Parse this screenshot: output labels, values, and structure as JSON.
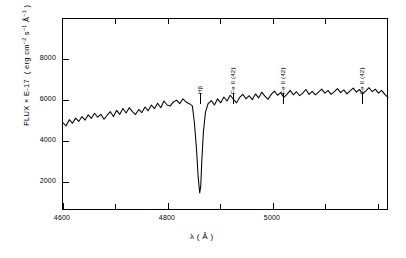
{
  "figure": {
    "background": "#ffffff",
    "ink": "#000000"
  },
  "axes": {
    "x": {
      "label": "λ (Å)",
      "min": 4600,
      "max": 5220,
      "major_ticks": [
        4600,
        4800,
        5000
      ],
      "major_tick_labels": [
        "4600",
        "4800",
        "5000"
      ],
      "minor_ticks": [
        4700,
        4900,
        5100,
        5200
      ]
    },
    "y": {
      "label_text": "FLUX × E-17  ( erg cm",
      "label_full": "FLUX × E-17 ( erg cm^-2 s^-1 A^-1 )",
      "min": 640,
      "max": 9300,
      "major_ticks": [
        2000,
        4000,
        6000,
        8000
      ],
      "major_tick_labels": [
        "2000",
        "4000",
        "6000",
        "8000"
      ]
    }
  },
  "line_markers": [
    {
      "name": "h-beta",
      "label": "Hβ",
      "wavelength": 4861,
      "tick_top": 92,
      "tick_bottom": 103
    },
    {
      "name": "fe-ii-42-a",
      "label": "Fe II (42)",
      "wavelength": 4924,
      "tick_top": 92,
      "tick_bottom": 103
    },
    {
      "name": "fe-ii-42-b",
      "label": "Fe II (42)",
      "wavelength": 5018,
      "tick_top": 92,
      "tick_bottom": 103
    },
    {
      "name": "fe-ii-42-c",
      "label": "Fe II (42)",
      "wavelength": 5169,
      "tick_top": 92,
      "tick_bottom": 103
    }
  ],
  "chart_data": {
    "type": "line",
    "title": "",
    "xlabel": "λ (Å)",
    "ylabel": "FLUX × E-17 (erg cm^-2 s^-1 A^-1)",
    "xlim": [
      4600,
      5220
    ],
    "ylim": [
      640,
      9300
    ],
    "grid": false,
    "legend": null,
    "annotations": [
      "Hβ",
      "Fe II (42)",
      "Fe II (42)",
      "Fe II (42)"
    ],
    "series": [
      {
        "name": "spectrum",
        "color": "#000000",
        "x": [
          4600,
          4606,
          4612,
          4618,
          4624,
          4630,
          4636,
          4642,
          4648,
          4654,
          4660,
          4666,
          4672,
          4678,
          4684,
          4690,
          4696,
          4702,
          4708,
          4714,
          4720,
          4726,
          4732,
          4738,
          4744,
          4750,
          4756,
          4762,
          4768,
          4774,
          4780,
          4786,
          4792,
          4798,
          4804,
          4810,
          4816,
          4822,
          4828,
          4834,
          4840,
          4846,
          4850,
          4854,
          4857,
          4860,
          4862,
          4864,
          4867,
          4871,
          4876,
          4882,
          4888,
          4894,
          4900,
          4906,
          4912,
          4918,
          4924,
          4930,
          4936,
          4942,
          4948,
          4954,
          4960,
          4966,
          4972,
          4978,
          4984,
          4990,
          4996,
          5002,
          5008,
          5014,
          5020,
          5026,
          5032,
          5038,
          5044,
          5050,
          5056,
          5062,
          5068,
          5074,
          5080,
          5086,
          5092,
          5098,
          5104,
          5110,
          5116,
          5122,
          5128,
          5134,
          5140,
          5146,
          5152,
          5158,
          5164,
          5170,
          5176,
          5182,
          5188,
          5194,
          5200,
          5206,
          5212,
          5218
        ],
        "y": [
          4620,
          4480,
          4760,
          4600,
          4830,
          4680,
          4900,
          4740,
          4980,
          4820,
          5050,
          4870,
          5000,
          4780,
          4960,
          5120,
          4900,
          5180,
          5000,
          5260,
          5060,
          5300,
          5120,
          4990,
          5220,
          5080,
          5330,
          5160,
          5420,
          5260,
          5500,
          5300,
          5600,
          5420,
          5380,
          5560,
          5640,
          5480,
          5700,
          5560,
          5480,
          5380,
          4600,
          3400,
          2200,
          1450,
          1760,
          2900,
          4200,
          5100,
          5480,
          5620,
          5420,
          5700,
          5520,
          5780,
          5600,
          5860,
          5680,
          5520,
          5760,
          5900,
          5700,
          5840,
          5660,
          5920,
          5740,
          6000,
          5820,
          5680,
          5900,
          6050,
          5860,
          5980,
          5760,
          5900,
          6080,
          5880,
          6020,
          5840,
          5960,
          6120,
          5900,
          6040,
          5880,
          6000,
          6140,
          5960,
          6080,
          5900,
          6020,
          6160,
          5980,
          6100,
          5920,
          6060,
          6180,
          6000,
          6120,
          5940,
          6060,
          6200,
          6020,
          6140,
          5960,
          6080,
          5900,
          5760
        ]
      }
    ]
  }
}
